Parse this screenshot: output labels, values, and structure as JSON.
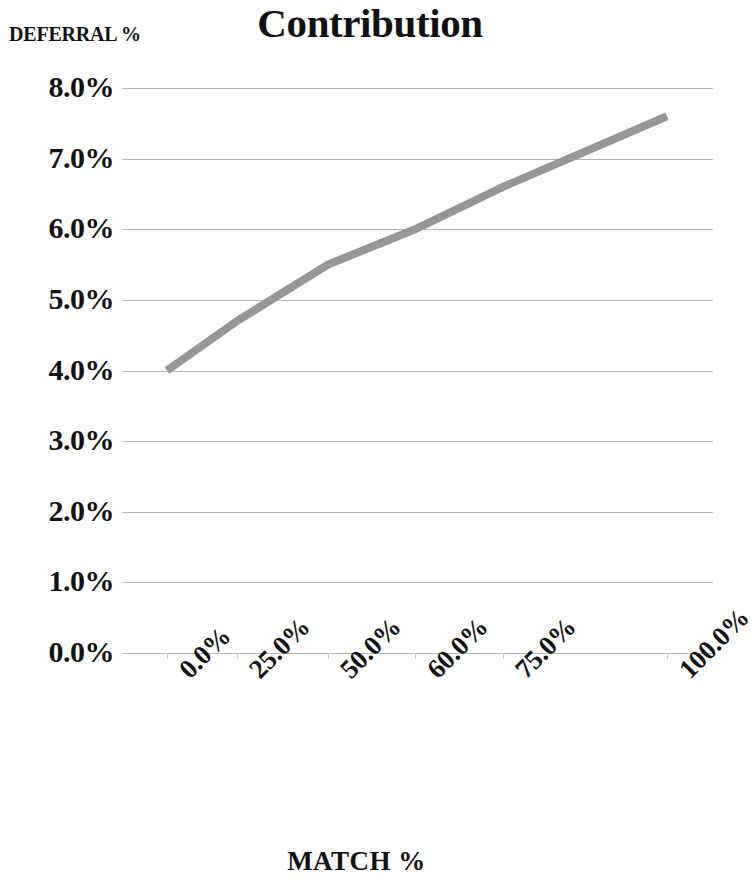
{
  "chart_data": {
    "type": "line",
    "title": "Contribution",
    "xlabel": "MATCH %",
    "ylabel": "DEFERRAL %",
    "categories": [
      "0.0%",
      "25.0%",
      "50.0%",
      "60.0%",
      "75.0%",
      "100.0%"
    ],
    "x_numeric": [
      0,
      25,
      50,
      60,
      75,
      100
    ],
    "values": [
      4.0,
      4.7,
      5.5,
      6.0,
      6.6,
      7.6
    ],
    "series": [
      {
        "name": "Contribution",
        "values": [
          4.0,
          4.7,
          5.5,
          6.0,
          6.6,
          7.6
        ],
        "color": "#969696"
      }
    ],
    "ylim": [
      0.0,
      8.0
    ],
    "y_ticks": [
      8.0,
      7.0,
      6.0,
      5.0,
      4.0,
      3.0,
      2.0,
      1.0,
      0.0
    ],
    "y_tick_labels": [
      "8.0%",
      "7.0%",
      "6.0%",
      "5.0%",
      "4.0%",
      "3.0%",
      "2.0%",
      "1.0%",
      "0.0%"
    ],
    "grid": true,
    "grid_color": "#b7b7b7",
    "legend": false,
    "legend_position": "none",
    "markers": false,
    "line_width_px": 8,
    "background": "#ffffff",
    "text_color": "#111111"
  },
  "labels": {
    "title": "Contribution",
    "y_axis_title": "DEFERRAL %",
    "x_axis_title": "MATCH %"
  }
}
